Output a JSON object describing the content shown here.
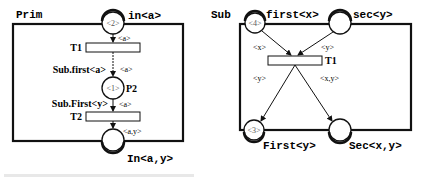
{
  "prim": {
    "title": "Prim",
    "input_place": {
      "label": "in<a>",
      "tokens": "<2>"
    },
    "transition_t1": {
      "label": "T1",
      "arc_in": "<a>",
      "arc_out": "<a>",
      "call": "Sub.first<a>"
    },
    "place_p2": {
      "label": "P2",
      "tokens": "<1>"
    },
    "transition_t2": {
      "label": "T2",
      "arc_in": "<a>",
      "arc_out": "<a,y>",
      "call": "Sub.First<y>"
    },
    "output_place": {
      "label": "In<a,y>",
      "tokens": ""
    }
  },
  "sub": {
    "title": "Sub",
    "place_first": {
      "label": "first<x>",
      "tokens": "<4>"
    },
    "place_sec": {
      "label": "sec<y>",
      "tokens": ""
    },
    "transition_t1": {
      "label": "T1",
      "arc_in_left": "<x>",
      "arc_in_right": "<y>",
      "arc_out_left": "<y>",
      "arc_out_right": "<x,y>"
    },
    "place_First": {
      "label": "First<y>",
      "tokens": "<3>"
    },
    "place_Sec": {
      "label": "Sec<x,y>",
      "tokens": ""
    }
  },
  "colors": {
    "stroke": "#111111",
    "background": "#ffffff",
    "token_text": "#555555"
  }
}
